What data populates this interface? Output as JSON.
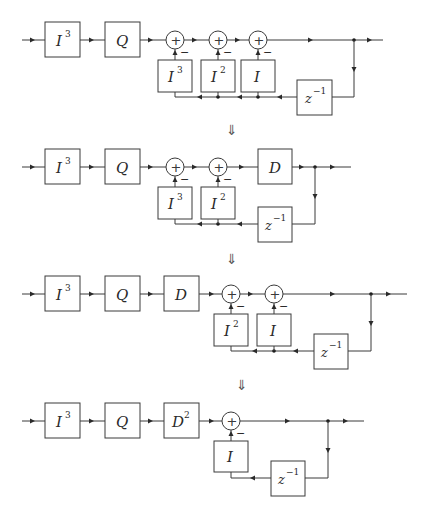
{
  "figure": {
    "implies_symbol": "⇓",
    "diagrams": [
      {
        "id": 1,
        "forward_blocks": [
          {
            "base": "I",
            "sup": "3"
          },
          {
            "base": "Q",
            "sup": ""
          }
        ],
        "summers": 3,
        "feedback_blocks": [
          {
            "base": "I",
            "sup": "3"
          },
          {
            "base": "I",
            "sup": "2"
          },
          {
            "base": "I",
            "sup": ""
          }
        ],
        "delay": {
          "base": "z",
          "sup": "−1"
        },
        "sign": "−"
      },
      {
        "id": 2,
        "forward_blocks": [
          {
            "base": "I",
            "sup": "3"
          },
          {
            "base": "Q",
            "sup": ""
          }
        ],
        "summers": 2,
        "feedback_blocks": [
          {
            "base": "I",
            "sup": "3"
          },
          {
            "base": "I",
            "sup": "2"
          }
        ],
        "post_block": {
          "base": "D",
          "sup": ""
        },
        "delay": {
          "base": "z",
          "sup": "−1"
        },
        "sign": "−"
      },
      {
        "id": 3,
        "forward_blocks": [
          {
            "base": "I",
            "sup": "3"
          },
          {
            "base": "Q",
            "sup": ""
          },
          {
            "base": "D",
            "sup": ""
          }
        ],
        "summers": 2,
        "feedback_blocks": [
          {
            "base": "I",
            "sup": "2"
          },
          {
            "base": "I",
            "sup": ""
          }
        ],
        "delay": {
          "base": "z",
          "sup": "−1"
        },
        "sign": "−"
      },
      {
        "id": 4,
        "forward_blocks": [
          {
            "base": "I",
            "sup": "3"
          },
          {
            "base": "Q",
            "sup": ""
          },
          {
            "base": "D",
            "sup": "2"
          }
        ],
        "summers": 1,
        "feedback_blocks": [
          {
            "base": "I",
            "sup": ""
          }
        ],
        "delay": {
          "base": "z",
          "sup": "−1"
        },
        "sign": "−"
      }
    ]
  }
}
